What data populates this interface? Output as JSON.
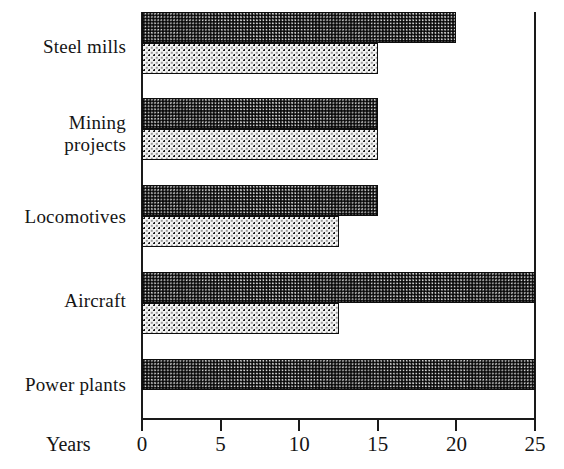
{
  "chart_data": {
    "type": "bar",
    "orientation": "horizontal",
    "title": "",
    "subtitle": "",
    "xlabel": "Years",
    "ylabel": "",
    "xlim": [
      0,
      25
    ],
    "xticks": [
      0,
      5,
      10,
      15,
      20,
      25
    ],
    "xtick_labels": [
      "0",
      "5",
      "10",
      "15",
      "20",
      "25"
    ],
    "grid": false,
    "legend": "none",
    "categories": [
      "Steel mills",
      "Mining projects",
      "Locomotives",
      "Aircraft",
      "Power plants"
    ],
    "series": [
      {
        "name": "series-a",
        "pattern": "dense-checkerboard",
        "values": [
          20,
          15,
          15,
          25,
          25
        ]
      },
      {
        "name": "series-b",
        "pattern": "sparse-dots",
        "values": [
          15,
          15,
          12.5,
          12.5,
          null
        ]
      }
    ]
  },
  "axis": {
    "years_label": "Years",
    "line_color": "#1a1a1a"
  },
  "colors": {
    "ink": "#111111",
    "dense_fill": "#b9b9b9",
    "sparse_fill": "#f3f3f3",
    "bar_outline": "#0d0d0d",
    "background": "#ffffff"
  },
  "labels": {
    "steel_mills": "Steel mills",
    "mining_projects": "Mining\nprojects",
    "locomotives": "Locomotives",
    "aircraft": "Aircraft",
    "power_plants": "Power plants"
  },
  "ticks": {
    "t0": "0",
    "t5": "5",
    "t10": "10",
    "t15": "15",
    "t20": "20",
    "t25": "25"
  }
}
